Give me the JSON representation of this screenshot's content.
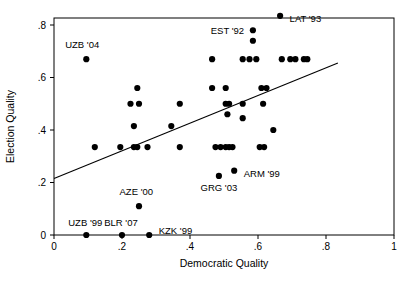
{
  "chart_data": {
    "type": "scatter",
    "title": "",
    "xlabel": "Democratic Quality",
    "ylabel": "Election Quality",
    "xlim": [
      0,
      1
    ],
    "ylim": [
      0,
      0.87
    ],
    "grid": false,
    "legend": null,
    "xticks": [
      0,
      0.2,
      0.4,
      0.6,
      0.8,
      1
    ],
    "xticklabels": [
      "0",
      ".2",
      ".4",
      ".6",
      ".8",
      "1"
    ],
    "yticks": [
      0,
      0.2,
      0.4,
      0.6,
      0.8
    ],
    "yticklabels": [
      "0",
      ".2",
      ".4",
      ".6",
      ".8"
    ],
    "points": [
      {
        "x": 0.095,
        "y": 0.67
      },
      {
        "x": 0.12,
        "y": 0.335
      },
      {
        "x": 0.095,
        "y": 0.0
      },
      {
        "x": 0.195,
        "y": 0.335
      },
      {
        "x": 0.2,
        "y": 0.0
      },
      {
        "x": 0.225,
        "y": 0.5
      },
      {
        "x": 0.235,
        "y": 0.335
      },
      {
        "x": 0.245,
        "y": 0.56
      },
      {
        "x": 0.245,
        "y": 0.335
      },
      {
        "x": 0.235,
        "y": 0.415
      },
      {
        "x": 0.25,
        "y": 0.5
      },
      {
        "x": 0.25,
        "y": 0.11
      },
      {
        "x": 0.275,
        "y": 0.335
      },
      {
        "x": 0.28,
        "y": 0.0
      },
      {
        "x": 0.345,
        "y": 0.415
      },
      {
        "x": 0.37,
        "y": 0.5
      },
      {
        "x": 0.37,
        "y": 0.335
      },
      {
        "x": 0.465,
        "y": 0.67
      },
      {
        "x": 0.465,
        "y": 0.56
      },
      {
        "x": 0.475,
        "y": 0.335
      },
      {
        "x": 0.49,
        "y": 0.335
      },
      {
        "x": 0.485,
        "y": 0.225
      },
      {
        "x": 0.505,
        "y": 0.56
      },
      {
        "x": 0.505,
        "y": 0.5
      },
      {
        "x": 0.515,
        "y": 0.5
      },
      {
        "x": 0.51,
        "y": 0.46
      },
      {
        "x": 0.505,
        "y": 0.335
      },
      {
        "x": 0.515,
        "y": 0.335
      },
      {
        "x": 0.525,
        "y": 0.335
      },
      {
        "x": 0.53,
        "y": 0.245
      },
      {
        "x": 0.555,
        "y": 0.67
      },
      {
        "x": 0.555,
        "y": 0.5
      },
      {
        "x": 0.555,
        "y": 0.445
      },
      {
        "x": 0.575,
        "y": 0.67
      },
      {
        "x": 0.585,
        "y": 0.78
      },
      {
        "x": 0.585,
        "y": 0.74
      },
      {
        "x": 0.595,
        "y": 0.67
      },
      {
        "x": 0.61,
        "y": 0.56
      },
      {
        "x": 0.615,
        "y": 0.5
      },
      {
        "x": 0.605,
        "y": 0.335
      },
      {
        "x": 0.618,
        "y": 0.335
      },
      {
        "x": 0.625,
        "y": 0.56
      },
      {
        "x": 0.645,
        "y": 0.4
      },
      {
        "x": 0.665,
        "y": 0.835
      },
      {
        "x": 0.67,
        "y": 0.67
      },
      {
        "x": 0.695,
        "y": 0.67
      },
      {
        "x": 0.71,
        "y": 0.67
      },
      {
        "x": 0.735,
        "y": 0.67
      },
      {
        "x": 0.745,
        "y": 0.67
      }
    ],
    "fit_line": {
      "x1": 0.0,
      "y1": 0.215,
      "x2": 0.835,
      "y2": 0.655
    },
    "annotations": [
      {
        "text": "UZB '04",
        "x": 0.095,
        "y": 0.67,
        "dx": -0.012,
        "dy": 0.055,
        "anchor": "middle"
      },
      {
        "text": "LAT '93",
        "x": 0.665,
        "y": 0.835,
        "dx": 0.028,
        "dy": -0.012,
        "anchor": "start"
      },
      {
        "text": "EST '92",
        "x": 0.585,
        "y": 0.78,
        "dx": -0.026,
        "dy": 0.0,
        "anchor": "end"
      },
      {
        "text": "ARM '99",
        "x": 0.53,
        "y": 0.245,
        "dx": 0.028,
        "dy": -0.012,
        "anchor": "start"
      },
      {
        "text": "GRG '03",
        "x": 0.485,
        "y": 0.225,
        "dx": 0.0,
        "dy": -0.045,
        "anchor": "middle"
      },
      {
        "text": "AZE '00",
        "x": 0.25,
        "y": 0.11,
        "dx": -0.008,
        "dy": 0.055,
        "anchor": "middle"
      },
      {
        "text": "UZB '99",
        "x": 0.095,
        "y": 0.0,
        "dx": -0.003,
        "dy": 0.048,
        "anchor": "middle"
      },
      {
        "text": "BLR '07",
        "x": 0.2,
        "y": 0.0,
        "dx": -0.003,
        "dy": 0.048,
        "anchor": "middle"
      },
      {
        "text": "KZK '99",
        "x": 0.28,
        "y": 0.0,
        "dx": 0.028,
        "dy": 0.018,
        "anchor": "start"
      }
    ],
    "marker_color": "#000000",
    "axis_color": "#000000",
    "background_color": "#ffffff"
  }
}
